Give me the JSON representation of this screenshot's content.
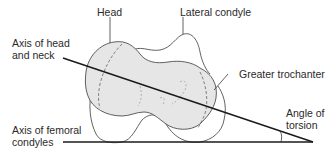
{
  "figure": {
    "labels": {
      "head": "Head",
      "lateral_condyle": "Lateral condyle",
      "axis_head_neck": "Axis of head\nand neck",
      "greater_trochanter": "Greater trochanter",
      "axis_femoral_condyles": "Axis of femoral\ncondyles",
      "angle_of_torsion": "Angle of\ntorsion"
    },
    "colors": {
      "outline": "#3a3a3a",
      "bone_fill": "#e6e6e6",
      "axis_line": "#1a1a1a",
      "text": "#2a2a2a"
    }
  }
}
